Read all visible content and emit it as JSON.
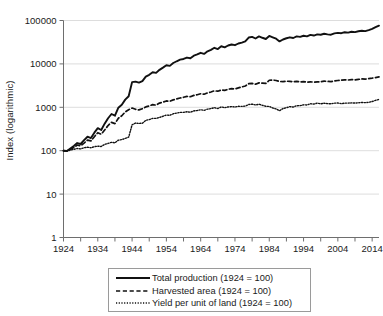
{
  "chart_data": {
    "type": "line",
    "title": "",
    "subtitle": "",
    "xlabel": "",
    "ylabel": "Index (logarithmic)",
    "yscale": "log",
    "ylim": [
      1,
      100000
    ],
    "xlim": [
      1924,
      2016
    ],
    "grid": true,
    "legend_position": "bottom",
    "y_tick_labels": [
      "100000",
      "10000",
      "1000",
      "100",
      "10",
      "1"
    ],
    "y_tick_values": [
      100000,
      10000,
      1000,
      100,
      10,
      1
    ],
    "x_tick_labels": [
      "1924",
      "1934",
      "1944",
      "1954",
      "1964",
      "1974",
      "1984",
      "1994",
      "2004",
      "2014"
    ],
    "x_tick_values": [
      1924,
      1934,
      1944,
      1954,
      1964,
      1974,
      1984,
      1994,
      2004,
      2014
    ],
    "x_minor_tick_interval": 5,
    "x": [
      1924,
      1925,
      1926,
      1927,
      1928,
      1929,
      1930,
      1931,
      1932,
      1933,
      1934,
      1935,
      1936,
      1937,
      1938,
      1939,
      1940,
      1941,
      1942,
      1943,
      1944,
      1945,
      1946,
      1947,
      1948,
      1949,
      1950,
      1951,
      1952,
      1953,
      1954,
      1955,
      1956,
      1957,
      1958,
      1959,
      1960,
      1961,
      1962,
      1963,
      1964,
      1965,
      1966,
      1967,
      1968,
      1969,
      1970,
      1971,
      1972,
      1973,
      1974,
      1975,
      1976,
      1977,
      1978,
      1979,
      1980,
      1981,
      1982,
      1983,
      1984,
      1985,
      1986,
      1987,
      1988,
      1989,
      1990,
      1991,
      1992,
      1993,
      1994,
      1995,
      1996,
      1997,
      1998,
      1999,
      2000,
      2001,
      2002,
      2003,
      2004,
      2005,
      2006,
      2007,
      2008,
      2009,
      2010,
      2011,
      2012,
      2013,
      2014,
      2015,
      2016
    ],
    "series": [
      {
        "name": "Total production (1924 = 100)",
        "style": "solid",
        "color": "#111111",
        "values": [
          100,
          98,
          112,
          128,
          150,
          143,
          175,
          210,
          196,
          260,
          330,
          300,
          420,
          560,
          700,
          640,
          980,
          1150,
          1500,
          1800,
          3800,
          3900,
          3700,
          4000,
          5100,
          5600,
          6400,
          6200,
          7300,
          8200,
          9300,
          9000,
          10500,
          11500,
          12500,
          13000,
          14000,
          13500,
          15500,
          16500,
          18000,
          17000,
          19500,
          21000,
          23500,
          22000,
          25500,
          24000,
          26500,
          28000,
          27000,
          29500,
          31000,
          33000,
          40500,
          42000,
          38500,
          43000,
          40000,
          37500,
          44000,
          41000,
          38000,
          33000,
          36500,
          39000,
          41000,
          39500,
          43000,
          42000,
          44500,
          43000,
          46500,
          45000,
          48000,
          47000,
          49500,
          48000,
          47000,
          50500,
          52000,
          51000,
          53500,
          52500,
          55000,
          54000,
          56500,
          58000,
          57000,
          60000,
          64000,
          70000,
          76000
        ]
      },
      {
        "name": "Harvested area (1924 = 100)",
        "style": "dashed",
        "color": "#111111",
        "values": [
          100,
          99,
          108,
          118,
          135,
          130,
          150,
          175,
          168,
          210,
          260,
          240,
          300,
          380,
          450,
          420,
          560,
          640,
          780,
          880,
          960,
          900,
          870,
          930,
          1020,
          1080,
          1150,
          1120,
          1250,
          1320,
          1400,
          1380,
          1480,
          1560,
          1640,
          1700,
          1780,
          1750,
          1880,
          1950,
          2050,
          2000,
          2150,
          2250,
          2400,
          2350,
          2500,
          2450,
          2600,
          2700,
          2650,
          2800,
          2950,
          3100,
          3500,
          3550,
          3400,
          3650,
          3600,
          3550,
          4200,
          4250,
          4150,
          3950,
          3900,
          4000,
          3950,
          3900,
          3950,
          3850,
          3900,
          3800,
          3850,
          3800,
          3850,
          3900,
          4000,
          3950,
          3900,
          4050,
          4150,
          4200,
          4300,
          4250,
          4350,
          4300,
          4400,
          4500,
          4450,
          4600,
          4700,
          4850,
          5000
        ]
      },
      {
        "name": "Yield per unit of land (1924 = 100)",
        "style": "dotted",
        "color": "#111111",
        "values": [
          100,
          99,
          103,
          108,
          112,
          110,
          117,
          120,
          117,
          124,
          127,
          125,
          140,
          147,
          156,
          152,
          175,
          180,
          192,
          205,
          396,
          433,
          425,
          430,
          500,
          519,
          557,
          554,
          584,
          621,
          664,
          652,
          709,
          737,
          762,
          765,
          787,
          771,
          824,
          846,
          878,
          850,
          907,
          933,
          979,
          936,
          1020,
          980,
          1019,
          1037,
          1019,
          1054,
          1051,
          1065,
          1157,
          1183,
          1132,
          1178,
          1111,
          1056,
          1048,
          965,
          916,
          835,
          936,
          975,
          1038,
          1013,
          1089,
          1091,
          1141,
          1132,
          1208,
          1184,
          1247,
          1205,
          1238,
          1215,
          1205,
          1247,
          1253,
          1214,
          1244,
          1250,
          1264,
          1256,
          1270,
          1289,
          1281,
          1304,
          1362,
          1443,
          1520
        ]
      }
    ]
  },
  "legend": {
    "items": [
      {
        "label": "Total production (1924 = 100)",
        "style": "solid"
      },
      {
        "label": "Harvested area (1924 = 100)",
        "style": "dashed"
      },
      {
        "label": "Yield per unit of land (1924 = 100)",
        "style": "dotted"
      }
    ]
  }
}
